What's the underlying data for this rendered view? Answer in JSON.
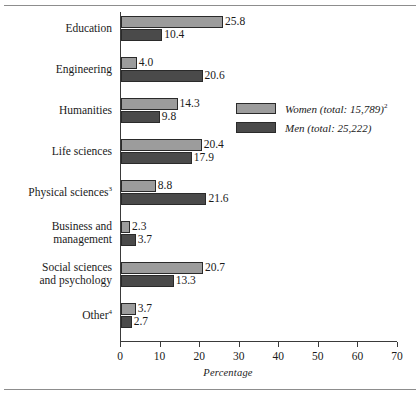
{
  "chart_data": {
    "type": "bar",
    "orientation": "horizontal",
    "title": "",
    "xlabel": "Percentage",
    "ylabel": "",
    "xlim": [
      0,
      70
    ],
    "xticks": [
      0,
      10,
      20,
      30,
      40,
      50,
      60,
      70
    ],
    "grid": false,
    "legend_position": "inside-upper-right",
    "categories": [
      "Education",
      "Engineering",
      "Humanities",
      "Life sciences",
      "Physical sciences",
      "Business and management",
      "Social sciences and psychology",
      "Other"
    ],
    "category_footnotes": {
      "Physical sciences": "3",
      "Other": "4"
    },
    "series": [
      {
        "name": "Women (total: 15,789)",
        "footnote": "2",
        "color": "#9c9c9c",
        "values": [
          25.8,
          4.0,
          14.3,
          20.4,
          8.8,
          2.3,
          20.7,
          3.7
        ]
      },
      {
        "name": "Men (total: 25,222)",
        "footnote": "",
        "color": "#4a4a4a",
        "values": [
          10.4,
          20.6,
          9.8,
          17.9,
          21.6,
          3.7,
          13.3,
          2.7
        ]
      }
    ]
  },
  "axis": {
    "x_title": "Percentage",
    "tick_labels": [
      "0",
      "10",
      "20",
      "30",
      "40",
      "50",
      "60",
      "70"
    ]
  },
  "categories": [
    {
      "line1": "Education",
      "line2": "",
      "footnote": ""
    },
    {
      "line1": "Engineering",
      "line2": "",
      "footnote": ""
    },
    {
      "line1": "Humanities",
      "line2": "",
      "footnote": ""
    },
    {
      "line1": "Life sciences",
      "line2": "",
      "footnote": ""
    },
    {
      "line1": "Physical sciences",
      "line2": "",
      "footnote": "3"
    },
    {
      "line1": "Business and",
      "line2": "management",
      "footnote": ""
    },
    {
      "line1": "Social sciences",
      "line2": "and psychology",
      "footnote": ""
    },
    {
      "line1": "Other",
      "line2": "",
      "footnote": "4"
    }
  ],
  "values": {
    "women": [
      "25.8",
      "4.0",
      "14.3",
      "20.4",
      "8.8",
      "2.3",
      "20.7",
      "3.7"
    ],
    "men": [
      "10.4",
      "20.6",
      "9.8",
      "17.9",
      "21.6",
      "3.7",
      "13.3",
      "2.7"
    ]
  },
  "legend": {
    "women_label": "Women (total: 15,789)",
    "women_footnote": "2",
    "men_label": "Men (total: 25,222)",
    "men_footnote": "",
    "women_color": "#9c9c9c",
    "men_color": "#4a4a4a"
  }
}
